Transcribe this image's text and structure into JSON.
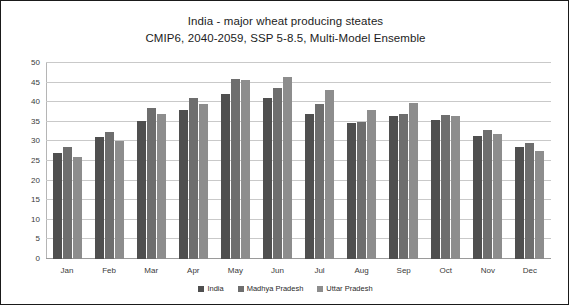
{
  "chart_data": {
    "type": "bar",
    "title": "India - major wheat producing steates",
    "subtitle": "CMIP6, 2040-2059, SSP 5-8.5, Multi-Model Ensemble",
    "xlabel": "",
    "ylabel": "",
    "ylim": [
      0,
      50
    ],
    "yticks": [
      0,
      5,
      10,
      15,
      20,
      25,
      30,
      35,
      40,
      45,
      50
    ],
    "grid": true,
    "legend_position": "bottom",
    "categories": [
      "Jan",
      "Feb",
      "Mar",
      "Apr",
      "May",
      "Jun",
      "Jul",
      "Aug",
      "Sep",
      "Oct",
      "Nov",
      "Dec"
    ],
    "series": [
      {
        "name": "India",
        "color": "#4f4f4f",
        "values": [
          27.0,
          31.0,
          35.3,
          38.0,
          42.0,
          41.0,
          37.0,
          34.8,
          36.5,
          35.5,
          31.5,
          28.5
        ]
      },
      {
        "name": "Madhya Pradesh",
        "color": "#6e6e6e",
        "values": [
          28.5,
          32.3,
          38.5,
          41.0,
          45.8,
          43.5,
          39.5,
          35.0,
          37.0,
          36.7,
          33.0,
          29.5
        ]
      },
      {
        "name": "Uttar Pradesh",
        "color": "#8d8d8d",
        "values": [
          26.0,
          30.0,
          37.0,
          39.5,
          45.7,
          46.5,
          43.0,
          38.0,
          39.7,
          36.5,
          32.0,
          27.5
        ]
      }
    ]
  }
}
